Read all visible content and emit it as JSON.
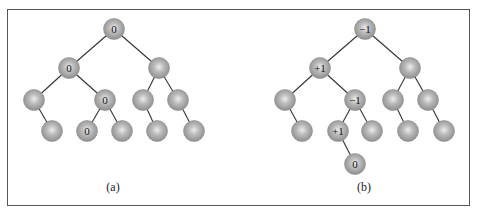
{
  "figure": {
    "colors": {
      "node_fill": "#a4a4a4",
      "node_highlight": "#e8e8e8",
      "node_stroke": "#8a8a8a",
      "edge": "#333333",
      "border": "#555555",
      "label_text": "#111111"
    },
    "node_radius": 10.5,
    "panels": [
      {
        "id": "a",
        "caption": "(a)",
        "caption_pos": [
          113,
          180
        ],
        "nodes": [
          {
            "id": "a0",
            "x": 114,
            "y": 29,
            "label": "0"
          },
          {
            "id": "a1",
            "x": 69,
            "y": 68,
            "label": "0"
          },
          {
            "id": "a2",
            "x": 159,
            "y": 68,
            "label": ""
          },
          {
            "id": "a3",
            "x": 34,
            "y": 100,
            "label": ""
          },
          {
            "id": "a4",
            "x": 105,
            "y": 100,
            "label": "0"
          },
          {
            "id": "a5",
            "x": 143,
            "y": 100,
            "label": ""
          },
          {
            "id": "a6",
            "x": 178,
            "y": 100,
            "label": ""
          },
          {
            "id": "a7",
            "x": 52,
            "y": 131,
            "label": ""
          },
          {
            "id": "a8",
            "x": 87,
            "y": 131,
            "label": "0"
          },
          {
            "id": "a9",
            "x": 122,
            "y": 131,
            "label": ""
          },
          {
            "id": "a10",
            "x": 157,
            "y": 131,
            "label": ""
          },
          {
            "id": "a11",
            "x": 194,
            "y": 131,
            "label": ""
          }
        ],
        "edges": [
          [
            "a0",
            "a1"
          ],
          [
            "a0",
            "a2"
          ],
          [
            "a1",
            "a3"
          ],
          [
            "a1",
            "a4"
          ],
          [
            "a2",
            "a5"
          ],
          [
            "a2",
            "a6"
          ],
          [
            "a3",
            "a7"
          ],
          [
            "a4",
            "a8"
          ],
          [
            "a4",
            "a9"
          ],
          [
            "a5",
            "a10"
          ],
          [
            "a6",
            "a11"
          ]
        ]
      },
      {
        "id": "b",
        "caption": "(b)",
        "caption_pos": [
          364,
          180
        ],
        "nodes": [
          {
            "id": "b0",
            "x": 365,
            "y": 29,
            "label": "−1"
          },
          {
            "id": "b1",
            "x": 320,
            "y": 68,
            "label": "+1"
          },
          {
            "id": "b2",
            "x": 410,
            "y": 68,
            "label": ""
          },
          {
            "id": "b3",
            "x": 285,
            "y": 100,
            "label": ""
          },
          {
            "id": "b4",
            "x": 355,
            "y": 100,
            "label": "−1"
          },
          {
            "id": "b5",
            "x": 393,
            "y": 100,
            "label": ""
          },
          {
            "id": "b6",
            "x": 428,
            "y": 100,
            "label": ""
          },
          {
            "id": "b7",
            "x": 302,
            "y": 131,
            "label": ""
          },
          {
            "id": "b8",
            "x": 338,
            "y": 131,
            "label": "+1"
          },
          {
            "id": "b9",
            "x": 372,
            "y": 131,
            "label": ""
          },
          {
            "id": "b10",
            "x": 408,
            "y": 131,
            "label": ""
          },
          {
            "id": "b11",
            "x": 444,
            "y": 131,
            "label": ""
          },
          {
            "id": "b12",
            "x": 355,
            "y": 164,
            "label": "0"
          }
        ],
        "edges": [
          [
            "b0",
            "b1"
          ],
          [
            "b0",
            "b2"
          ],
          [
            "b1",
            "b3"
          ],
          [
            "b1",
            "b4"
          ],
          [
            "b2",
            "b5"
          ],
          [
            "b2",
            "b6"
          ],
          [
            "b3",
            "b7"
          ],
          [
            "b4",
            "b8"
          ],
          [
            "b4",
            "b9"
          ],
          [
            "b5",
            "b10"
          ],
          [
            "b6",
            "b11"
          ],
          [
            "b8",
            "b12"
          ]
        ]
      }
    ]
  }
}
